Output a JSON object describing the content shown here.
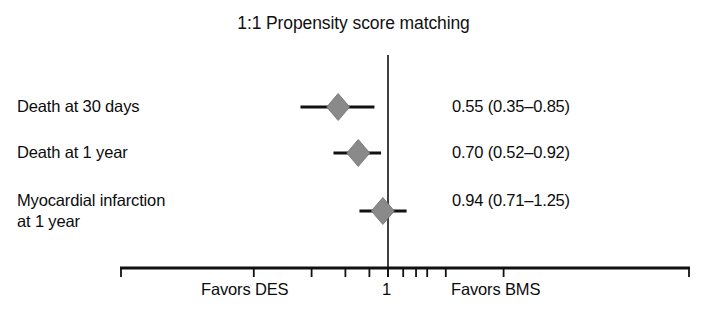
{
  "chart_data": {
    "type": "forest",
    "title": "1:1 Propensity score matching",
    "xlabel": "",
    "ylabel": "",
    "scale": "log",
    "reference_line": 1,
    "xlim": [
      0.18,
      4.6
    ],
    "grid": false,
    "legend": "none",
    "axis": {
      "reference_tick_label": "1",
      "left_annotation": "Favors DES",
      "right_annotation": "Favors BMS",
      "tick_values": [
        0.2,
        0.4,
        0.6,
        0.8,
        1.0,
        1.2,
        1.4,
        1.6,
        2.0,
        4.0
      ]
    },
    "categories": [
      "Death at 30 days",
      "Death at 1 year",
      "Myocardial infarction\nat 1 year"
    ],
    "effect_measure": "hazard ratio",
    "points": [
      {
        "label": "Death at 30 days",
        "estimate": 0.55,
        "ci_low": 0.35,
        "ci_high": 0.85,
        "value_text": "0.55 (0.35–0.85)"
      },
      {
        "label": "Death at 1 year",
        "estimate": 0.7,
        "ci_low": 0.52,
        "ci_high": 0.92,
        "value_text": "0.70 (0.52–0.92)"
      },
      {
        "label": "Myocardial infarction at 1 year",
        "estimate": 0.94,
        "ci_low": 0.71,
        "ci_high": 1.25,
        "value_text": "0.94 (0.71–1.25)"
      }
    ],
    "colors": {
      "marker_fill": "#8a8a8a",
      "marker_stroke": "#6f6f6f",
      "line": "#111111",
      "axis": "#111111",
      "text": "#0c0c0c",
      "background": "#ffffff"
    }
  },
  "rows": [
    {
      "label": "Death at 30 days",
      "value_text": "0.55 (0.35–0.85)"
    },
    {
      "label": "Death at 1 year",
      "value_text": "0.70 (0.52–0.92)"
    },
    {
      "label": "Myocardial infarction\nat 1 year",
      "value_text": "0.94 (0.71–1.25)"
    }
  ],
  "axis": {
    "favors_left": "Favors DES",
    "reference_label": "1",
    "favors_right": "Favors BMS"
  },
  "title": "1:1 Propensity score matching"
}
